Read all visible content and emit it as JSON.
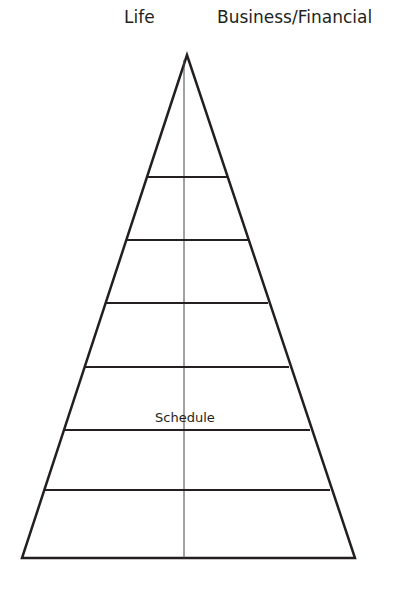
{
  "diagram": {
    "type": "pyramid",
    "labels": {
      "left_top": "Life",
      "right_top": "Business/Financial",
      "tier_label": "Schedule"
    },
    "geometry": {
      "apex": [
        187,
        55
      ],
      "base_left": [
        22,
        558
      ],
      "base_right": [
        355,
        558
      ],
      "center_line_x": 184,
      "tier_lines_y": [
        177,
        240,
        303,
        367,
        430,
        490
      ]
    },
    "tier_count": 7,
    "colors": {
      "stroke": "#231f20",
      "background": "#ffffff"
    }
  }
}
